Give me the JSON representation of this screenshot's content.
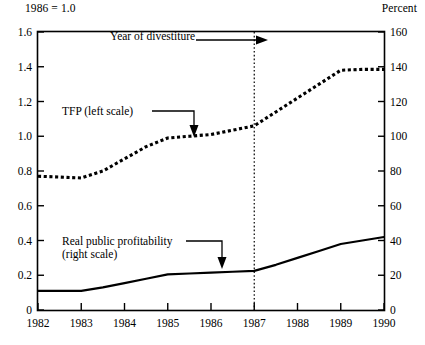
{
  "header": {
    "left_note": "1986 = 1.0",
    "right_note": "Percent"
  },
  "annotations": {
    "divestiture": "Year of divestiture",
    "tfp": "TFP (left scale)",
    "profitability_line1": "Real public profitability",
    "profitability_line2": "(right scale)"
  },
  "colors": {
    "ink": "#000000",
    "background": "#ffffff"
  },
  "chart_data": {
    "type": "line",
    "title": "",
    "xlabel": "",
    "ylabel": "",
    "y2label": "Percent",
    "subtitle": "1986 = 1.0",
    "grid": false,
    "legend": "annotations",
    "x": [
      1982,
      1983,
      1984,
      1985,
      1986,
      1987,
      1988,
      1989,
      1990
    ],
    "xlim": [
      1982,
      1990
    ],
    "xticks": [
      1982,
      1983,
      1984,
      1985,
      1986,
      1987,
      1988,
      1989,
      1990
    ],
    "xticklabels": [
      "1982",
      "1983",
      "1984",
      "1985",
      "1986",
      "1987",
      "1988",
      "1989",
      "1990"
    ],
    "ylim": [
      0,
      1.6
    ],
    "yticks": [
      0,
      0.2,
      0.4,
      0.6,
      0.8,
      1.0,
      1.2,
      1.4,
      1.6
    ],
    "yticklabels": [
      "0",
      "0.2",
      "0.4",
      "0.6",
      "0.8",
      "1.0",
      "1.2",
      "1.4",
      "1.6"
    ],
    "y2lim": [
      0,
      160
    ],
    "y2ticks": [
      0,
      20,
      40,
      60,
      80,
      100,
      120,
      140,
      160
    ],
    "y2ticklabels": [
      "0",
      "20",
      "40",
      "60",
      "80",
      "100",
      "120",
      "140",
      "160"
    ],
    "vline": {
      "x": 1987,
      "style": "dotted",
      "label": "Year of divestiture"
    },
    "series": [
      {
        "name": "TFP (left scale)",
        "axis": "left",
        "style": "dotted",
        "x": [
          1982,
          1982.5,
          1983,
          1983.5,
          1984,
          1984.5,
          1985,
          1985.5,
          1986,
          1986.5,
          1987,
          1987.5,
          1988,
          1988.5,
          1989,
          1989.5,
          1990
        ],
        "values": [
          0.77,
          0.765,
          0.76,
          0.8,
          0.87,
          0.94,
          0.99,
          1.0,
          1.01,
          1.035,
          1.06,
          1.14,
          1.22,
          1.3,
          1.38,
          1.385,
          1.385
        ]
      },
      {
        "name": "Real public profitability (right scale)",
        "axis": "right",
        "style": "solid",
        "x": [
          1982,
          1982.5,
          1983,
          1983.5,
          1984,
          1984.5,
          1985,
          1985.5,
          1986,
          1986.5,
          1987,
          1987.5,
          1988,
          1988.5,
          1989,
          1989.5,
          1990
        ],
        "values": [
          11.0,
          11.0,
          11.0,
          13.0,
          15.5,
          18.0,
          20.5,
          21.0,
          21.5,
          22.0,
          22.5,
          26.0,
          30.0,
          34.0,
          38.0,
          40.0,
          42.0
        ]
      }
    ]
  }
}
